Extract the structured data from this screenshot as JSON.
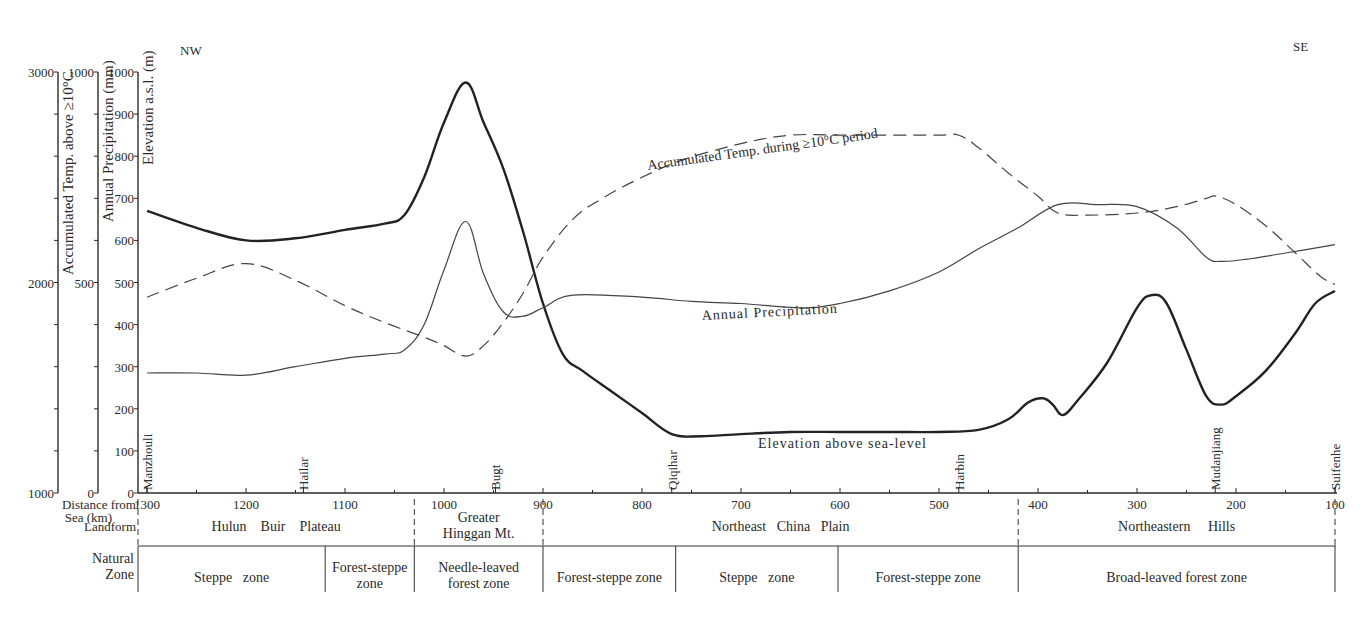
{
  "chart_data": {
    "type": "line",
    "title": "",
    "direction_labels": {
      "left": "NW",
      "right": "SE"
    },
    "xlabel": "Distance from Sea (km)",
    "x_range": [
      1300,
      100
    ],
    "x_ticks": [
      1300,
      1200,
      1100,
      1000,
      900,
      800,
      700,
      600,
      500,
      400,
      300,
      200,
      100
    ],
    "y_axes": [
      {
        "id": "temp",
        "label": "Accumulated Temp. above ≥10°C",
        "range": [
          1000,
          3000
        ],
        "tick_labels": [
          "1000",
          "2000",
          "3000"
        ]
      },
      {
        "id": "precip",
        "label": "Annual Precipitation (mm)",
        "range": [
          0,
          1000
        ],
        "tick_labels": [
          "0",
          "500",
          "1000"
        ]
      },
      {
        "id": "elev",
        "label": "Elevation a.s.l. (m)",
        "range": [
          0,
          1000
        ],
        "tick_labels": [
          "0",
          "100",
          "200",
          "300",
          "400",
          "500",
          "600",
          "700",
          "800",
          "900",
          "1000"
        ]
      }
    ],
    "series": [
      {
        "name": "Elevation above sea-level",
        "axis": "elev",
        "style": "thick-solid",
        "x": [
          1300,
          1250,
          1200,
          1150,
          1100,
          1060,
          1040,
          1020,
          1000,
          978,
          960,
          940,
          920,
          900,
          880,
          860,
          830,
          800,
          770,
          740,
          700,
          650,
          600,
          550,
          500,
          460,
          430,
          410,
          395,
          385,
          375,
          360,
          330,
          300,
          285,
          270,
          250,
          230,
          215,
          200,
          170,
          140,
          120,
          100
        ],
        "values": [
          670,
          630,
          600,
          605,
          625,
          640,
          660,
          750,
          880,
          975,
          880,
          770,
          620,
          450,
          330,
          290,
          240,
          190,
          140,
          135,
          140,
          145,
          145,
          145,
          145,
          150,
          175,
          215,
          225,
          210,
          185,
          220,
          310,
          440,
          470,
          450,
          340,
          230,
          210,
          230,
          290,
          380,
          450,
          480
        ]
      },
      {
        "name": "Annual Precipitation",
        "axis": "precip",
        "style": "thin-solid",
        "x": [
          1300,
          1250,
          1200,
          1150,
          1100,
          1060,
          1040,
          1020,
          1000,
          978,
          960,
          940,
          920,
          900,
          870,
          800,
          750,
          700,
          640,
          600,
          550,
          500,
          460,
          420,
          380,
          340,
          300,
          260,
          230,
          215,
          190,
          150,
          100
        ],
        "values": [
          285,
          285,
          280,
          300,
          320,
          330,
          340,
          400,
          530,
          645,
          520,
          430,
          420,
          440,
          470,
          465,
          455,
          450,
          440,
          450,
          480,
          525,
          580,
          630,
          685,
          685,
          680,
          630,
          560,
          550,
          555,
          570,
          590
        ]
      },
      {
        "name": "Accumulated Temp. during ≥10°C period",
        "axis": "temp",
        "style": "dashed",
        "x": [
          1300,
          1250,
          1200,
          1150,
          1100,
          1060,
          1020,
          1000,
          978,
          960,
          940,
          920,
          900,
          870,
          840,
          800,
          760,
          700,
          650,
          600,
          550,
          500,
          480,
          460,
          430,
          400,
          380,
          350,
          300,
          260,
          230,
          220,
          200,
          170,
          140,
          115,
          100
        ],
        "values": [
          1930,
          2020,
          2090,
          2010,
          1890,
          1810,
          1740,
          1700,
          1650,
          1700,
          1810,
          1950,
          2120,
          2300,
          2400,
          2500,
          2580,
          2660,
          2700,
          2700,
          2700,
          2700,
          2700,
          2640,
          2520,
          2410,
          2330,
          2320,
          2330,
          2360,
          2400,
          2410,
          2370,
          2270,
          2140,
          2030,
          1990
        ]
      }
    ],
    "series_labels": [
      "Accumulated Temp. during ≥10°C period",
      "Annual Precipitation",
      "Elevation above sea-level"
    ],
    "places": [
      {
        "name": "Manzhouli",
        "x": 1300
      },
      {
        "name": "Hailar",
        "x": 1142
      },
      {
        "name": "Bugt",
        "x": 948
      },
      {
        "name": "Qiqihar",
        "x": 770
      },
      {
        "name": "Harbin",
        "x": 480
      },
      {
        "name": "Mudanjiang",
        "x": 221
      },
      {
        "name": "Suifenhe",
        "x": 100
      }
    ],
    "landform": {
      "row_label": "Landform",
      "segments": [
        {
          "label": "Hulun Buir Plateau",
          "from": 1300,
          "to": 1030
        },
        {
          "label": "Greater Hinggan Mt.",
          "from": 1030,
          "to": 900
        },
        {
          "label": "Northeast China Plain",
          "from": 900,
          "to": 420
        },
        {
          "label": "Northeastern Hills",
          "from": 420,
          "to": 100
        }
      ]
    },
    "natural_zone": {
      "row_label": "Natural Zone",
      "segments": [
        {
          "label": "Steppe zone",
          "from": 1300,
          "to": 1120
        },
        {
          "label": "Forest-steppe zone",
          "from": 1120,
          "to": 1030
        },
        {
          "label": "Needle-leaved forest zone",
          "from": 1030,
          "to": 900
        },
        {
          "label": "Forest-steppe zone",
          "from": 900,
          "to": 766
        },
        {
          "label": "Steppe zone",
          "from": 766,
          "to": 602
        },
        {
          "label": "Forest-steppe zone",
          "from": 602,
          "to": 420
        },
        {
          "label": "Broad-leaved forest zone",
          "from": 420,
          "to": 100
        }
      ]
    }
  },
  "labels": {
    "nw": "NW",
    "se": "SE",
    "temp_axis_title": "Accumulated Temp. above ≥10°C",
    "precip_axis_title": "Annual Precipitation (mm)",
    "elev_axis_title": "Elevation a.s.l. (m)",
    "distance_label_1": "Distance from",
    "distance_label_2": "Sea (km)",
    "landform_label": "Landform",
    "zone_label_1": "Natural",
    "zone_label_2": "Zone",
    "landform_lines": [
      [
        "Hulun    Buir    Plateau"
      ],
      [
        "Greater",
        "Hinggan Mt."
      ],
      [
        "Northeast   China   Plain"
      ],
      [
        "Northeastern     Hills"
      ]
    ],
    "zone_lines": [
      [
        "Steppe   zone"
      ],
      [
        "Forest-steppe",
        "zone"
      ],
      [
        "Needle-leaved",
        "forest zone"
      ],
      [
        "Forest-steppe zone"
      ],
      [
        "Steppe   zone"
      ],
      [
        "Forest-steppe zone"
      ],
      [
        "Broad-leaved forest zone"
      ]
    ]
  }
}
